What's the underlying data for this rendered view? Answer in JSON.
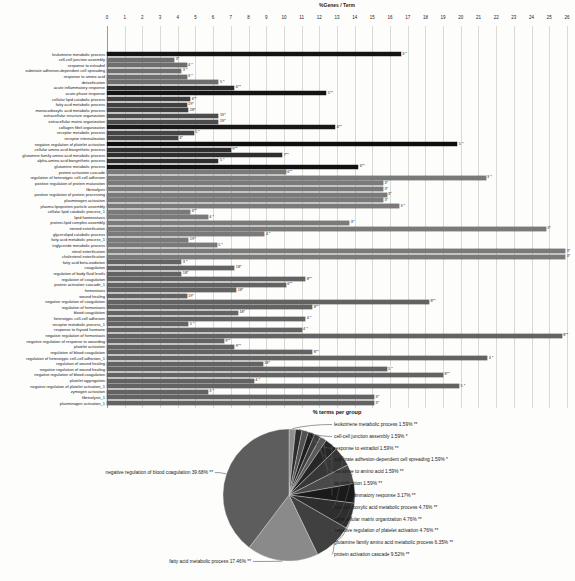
{
  "chart_data": [
    {
      "type": "bar",
      "orientation": "horizontal",
      "title": "%Genes / Term",
      "xlabel": "% terms per group",
      "xlim": [
        0,
        26
      ],
      "xticks": [
        0,
        1,
        2,
        3,
        4,
        5,
        6,
        7,
        8,
        9,
        10,
        11,
        12,
        13,
        14,
        15,
        16,
        17,
        18,
        19,
        20,
        21,
        22,
        23,
        24,
        25,
        26
      ],
      "grid": true,
      "bars": [
        {
          "label": "leukotriene metabolic process",
          "value": 16.6,
          "genes": "3 *",
          "color": "#141414"
        },
        {
          "label": "cell-cell junction assembly",
          "value": 3.8,
          "genes": "3*",
          "color": "#6e6e6e"
        },
        {
          "label": "response to estradiol",
          "value": 4.5,
          "genes": "4 *",
          "color": "#6e6e6e"
        },
        {
          "label": "substrate adhesion-dependent cell spreading",
          "value": 4.2,
          "genes": "3 *",
          "color": "#6e6e6e"
        },
        {
          "label": "response to amino acid",
          "value": 4.5,
          "genes": "3 *",
          "color": "#6e6e6e"
        },
        {
          "label": "detoxification",
          "value": 6.3,
          "genes": "5 *",
          "color": "#6e6e6e"
        },
        {
          "label": "acute inflammatory response",
          "value": 7.2,
          "genes": "6**",
          "color": "#2b2b2b"
        },
        {
          "label": "acute-phase response",
          "value": 12.4,
          "genes": "5**",
          "color": "#141414"
        },
        {
          "label": "cellular lipid catabolic process",
          "value": 4.7,
          "genes": "6**",
          "color": "#404040"
        },
        {
          "label": "fatty acid metabolic process",
          "value": 4.5,
          "genes": "19*",
          "color": "#404040"
        },
        {
          "label": "monocarboxylic acid metabolic process",
          "value": 4.6,
          "genes": "28*",
          "color": "#404040"
        },
        {
          "label": "extracellular structure organization",
          "value": 6.3,
          "genes": "19*",
          "color": "#4c4c4c"
        },
        {
          "label": "extracellular matrix organization",
          "value": 6.3,
          "genes": "19*",
          "color": "#4c4c4c"
        },
        {
          "label": "collagen fibril organization",
          "value": 12.9,
          "genes": "6**",
          "color": "#181818"
        },
        {
          "label": "receptor metabolic process",
          "value": 4.9,
          "genes": "5 *",
          "color": "#454545"
        },
        {
          "label": "receptor internalization",
          "value": 4.0,
          "genes": "3*",
          "color": "#454545"
        },
        {
          "label": "negative regulation of platelet activation",
          "value": 19.8,
          "genes": "5 *",
          "color": "#0e0e0e"
        },
        {
          "label": "cellular amino acid biosynthetic process",
          "value": 7.0,
          "genes": "9**",
          "color": "#2e2e2e"
        },
        {
          "label": "glutamine family amino acid metabolic process",
          "value": 9.9,
          "genes": "7**",
          "color": "#2e2e2e"
        },
        {
          "label": "alpha-amino acid biosynthetic process",
          "value": 6.3,
          "genes": "5 *",
          "color": "#2e2e2e"
        },
        {
          "label": "glutamine metabolic process",
          "value": 14.2,
          "genes": "6**",
          "color": "#111111"
        },
        {
          "label": "protein activation cascade",
          "value": 10.1,
          "genes": "6**",
          "color": "#7a7a7a"
        },
        {
          "label": "regulation of heterotypic cell-cell adhesion",
          "value": 21.4,
          "genes": "3 *",
          "color": "#7a7a7a"
        },
        {
          "label": "positive regulation of protein maturation",
          "value": 15.6,
          "genes": "3*",
          "color": "#7a7a7a"
        },
        {
          "label": "fibrinolysis",
          "value": 15.6,
          "genes": "3*",
          "color": "#7a7a7a"
        },
        {
          "label": "positive regulation of protein processing",
          "value": 15.8,
          "genes": "3*",
          "color": "#7a7a7a"
        },
        {
          "label": "plasminogen activation",
          "value": 15.6,
          "genes": "3*",
          "color": "#7a7a7a"
        },
        {
          "label": "plasma lipoprotein particle assembly",
          "value": 16.5,
          "genes": "3 *",
          "color": "#7a7a7a"
        },
        {
          "label": "cellular lipid catabolic process_1",
          "value": 4.7,
          "genes": "6**",
          "color": "#7a7a7a"
        },
        {
          "label": "lipid homeostasis",
          "value": 5.7,
          "genes": "4 *",
          "color": "#7a7a7a"
        },
        {
          "label": "protein-lipid complex assembly",
          "value": 13.7,
          "genes": "3*",
          "color": "#7a7a7a"
        },
        {
          "label": "steroid esterification",
          "value": 24.8,
          "genes": "3*",
          "color": "#7a7a7a"
        },
        {
          "label": "glycerolipid catabolic process",
          "value": 8.9,
          "genes": "4 *",
          "color": "#7a7a7a"
        },
        {
          "label": "fatty acid metabolic process_1",
          "value": 4.6,
          "genes": "19*",
          "color": "#7a7a7a"
        },
        {
          "label": "triglyceride metabolic process",
          "value": 6.2,
          "genes": "5 *",
          "color": "#7a7a7a"
        },
        {
          "label": "sterol esterification",
          "value": 25.9,
          "genes": "3*",
          "color": "#7a7a7a"
        },
        {
          "label": "cholesterol esterification",
          "value": 25.9,
          "genes": "3*",
          "color": "#7a7a7a"
        },
        {
          "label": "fatty acid beta-oxidation",
          "value": 4.2,
          "genes": "3 *",
          "color": "#636363"
        },
        {
          "label": "coagulation",
          "value": 7.2,
          "genes": "18*",
          "color": "#636363"
        },
        {
          "label": "regulation of body fluid levels",
          "value": 4.2,
          "genes": "18*",
          "color": "#636363"
        },
        {
          "label": "regulation of coagulation",
          "value": 11.2,
          "genes": "8**",
          "color": "#636363"
        },
        {
          "label": "protein activation cascade_1",
          "value": 10.1,
          "genes": "6**",
          "color": "#636363"
        },
        {
          "label": "hemostasis",
          "value": 7.3,
          "genes": "18*",
          "color": "#636363"
        },
        {
          "label": "wound healing",
          "value": 4.5,
          "genes": "19*",
          "color": "#636363"
        },
        {
          "label": "negative regulation of coagulation",
          "value": 18.2,
          "genes": "8**",
          "color": "#636363"
        },
        {
          "label": "regulation of hemostasis",
          "value": 11.6,
          "genes": "8**",
          "color": "#636363"
        },
        {
          "label": "blood coagulation",
          "value": 7.4,
          "genes": "18*",
          "color": "#636363"
        },
        {
          "label": "heterotypic cell-cell adhesion",
          "value": 11.2,
          "genes": "4 *",
          "color": "#636363"
        },
        {
          "label": "receptor metabolic process_1",
          "value": 4.6,
          "genes": "5 *",
          "color": "#636363"
        },
        {
          "label": "response to thyroid hormone",
          "value": 11.0,
          "genes": "4 *",
          "color": "#636363"
        },
        {
          "label": "negative regulation of hemostasis",
          "value": 25.7,
          "genes": "8**",
          "color": "#636363"
        },
        {
          "label": "negative regulation of response to wounding",
          "value": 6.6,
          "genes": "9**",
          "color": "#636363"
        },
        {
          "label": "platelet activation",
          "value": 7.2,
          "genes": "9**",
          "color": "#636363"
        },
        {
          "label": "regulation of blood coagulation",
          "value": 11.6,
          "genes": "8**",
          "color": "#636363"
        },
        {
          "label": "regulation of heterotypic cell-cell adhesion_1",
          "value": 21.5,
          "genes": "3 *",
          "color": "#636363"
        },
        {
          "label": "regulation of wound healing",
          "value": 8.8,
          "genes": "18*",
          "color": "#636363"
        },
        {
          "label": "negative regulation of wound healing",
          "value": 15.8,
          "genes": "5 *",
          "color": "#636363"
        },
        {
          "label": "negative regulation of blood coagulation",
          "value": 19.0,
          "genes": "8**",
          "color": "#636363"
        },
        {
          "label": "platelet aggregation",
          "value": 8.3,
          "genes": "4 *",
          "color": "#636363"
        },
        {
          "label": "negative regulation of platelet activation_1",
          "value": 19.9,
          "genes": "5 *",
          "color": "#636363"
        },
        {
          "label": "zymogen activation",
          "value": 5.7,
          "genes": "3 *",
          "color": "#636363"
        },
        {
          "label": "fibrinolysis_1",
          "value": 15.1,
          "genes": "3*",
          "color": "#636363"
        },
        {
          "label": "plasminogen activation_1",
          "value": 15.1,
          "genes": "3*",
          "color": "#636363"
        }
      ]
    },
    {
      "type": "pie",
      "start_angle_deg": 0,
      "direction": "clockwise",
      "slices": [
        {
          "label": "leukotriene metabolic process",
          "value": 1.59,
          "sig": "**",
          "color": "#8f8f8f",
          "side": "right"
        },
        {
          "label": "cell-cell junction assembly",
          "value": 1.59,
          "sig": "*",
          "color": "#2c2c2c",
          "side": "right"
        },
        {
          "label": "response to estradiol",
          "value": 1.59,
          "sig": "**",
          "color": "#515151",
          "side": "right"
        },
        {
          "label": "substrate adhesion-dependent cell spreading",
          "value": 1.59,
          "sig": "*",
          "color": "#1f1f1f",
          "side": "right"
        },
        {
          "label": "response to amino acid",
          "value": 1.59,
          "sig": "**",
          "color": "#3d3d3d",
          "side": "right"
        },
        {
          "label": "detoxification",
          "value": 1.59,
          "sig": "**",
          "color": "#5a5a5a",
          "side": "right"
        },
        {
          "label": "acute inflammatory response",
          "value": 3.17,
          "sig": "**",
          "color": "#262626",
          "side": "right"
        },
        {
          "label": "monocarboxylic acid metabolic process",
          "value": 4.76,
          "sig": "**",
          "color": "#373737",
          "side": "right"
        },
        {
          "label": "extracellular matrix organization",
          "value": 4.76,
          "sig": "**",
          "color": "#494949",
          "side": "right"
        },
        {
          "label": "negative regulation of platelet activation",
          "value": 4.76,
          "sig": "**",
          "color": "#1a1a1a",
          "side": "right"
        },
        {
          "label": "glutamine family amino acid metabolic process",
          "value": 6.35,
          "sig": "**",
          "color": "#2e2e2e",
          "side": "right"
        },
        {
          "label": "protein activation cascade",
          "value": 9.52,
          "sig": "**",
          "color": "#404040",
          "side": "right"
        },
        {
          "label": "fatty acid metabolic process",
          "value": 17.46,
          "sig": "**",
          "color": "#8a8a8a",
          "side": "left"
        },
        {
          "label": "negative regulation of blood coagulation",
          "value": 39.68,
          "sig": "**",
          "color": "#5d5d5d",
          "side": "left"
        }
      ]
    }
  ]
}
